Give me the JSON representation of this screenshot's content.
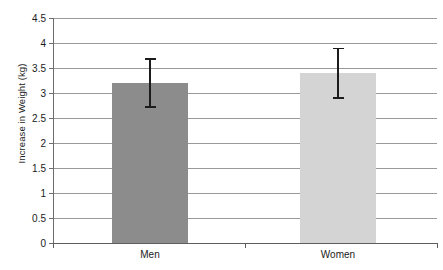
{
  "chart_data": {
    "type": "bar",
    "title": "",
    "xlabel": "",
    "ylabel": "Increase in Weight (kg)",
    "categories": [
      "Men",
      "Women"
    ],
    "values": [
      3.2,
      3.4
    ],
    "errors": [
      0.5,
      0.51
    ],
    "error_low": [
      2.7,
      2.89
    ],
    "error_high": [
      3.7,
      3.91
    ],
    "ylim": [
      0,
      4.5
    ],
    "ytick_labels": [
      "0",
      "0.5",
      "1",
      "1.5",
      "2",
      "2.5",
      "3",
      "3.5",
      "4",
      "4.5"
    ],
    "ytick_values": [
      0,
      0.5,
      1,
      1.5,
      2,
      2.5,
      3,
      3.5,
      4,
      4.5
    ],
    "grid": true,
    "legend": "none",
    "bar_colors": [
      "#8c8c8c",
      "#d4d4d4"
    ],
    "bar_edge_colors": [
      "#8c8c8c",
      "#cccccc"
    ],
    "errorbar_color": "#1c1c1c",
    "gridline_color": "#9a9a9a",
    "axis_color": "#5e5e5e",
    "background": "#ffffff"
  }
}
